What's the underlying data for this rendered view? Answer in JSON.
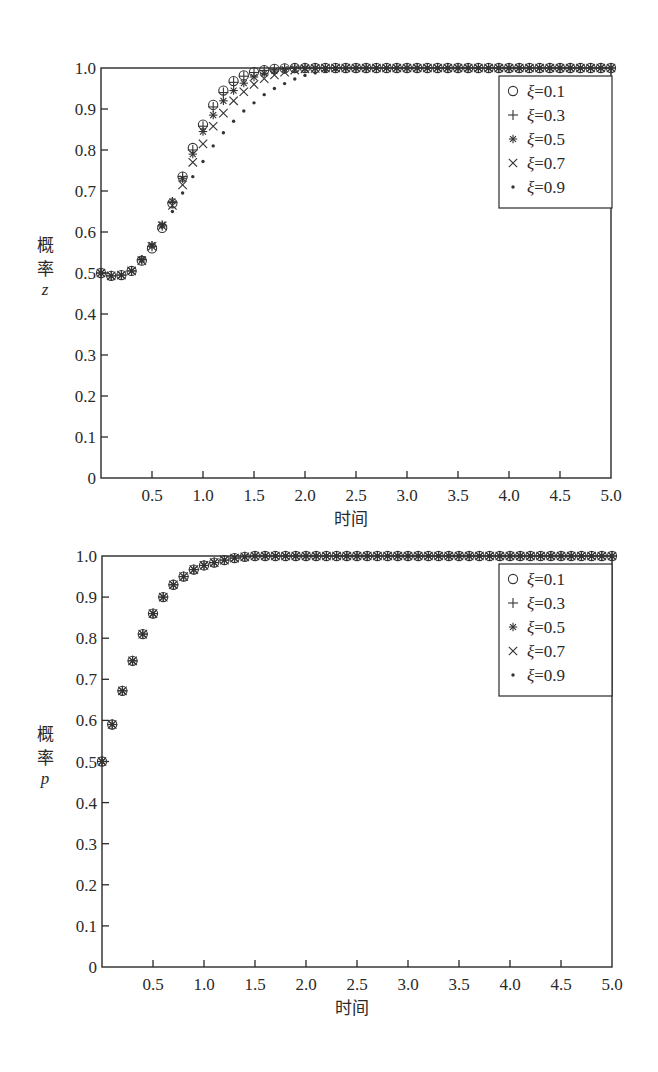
{
  "chart_data": [
    {
      "type": "scatter",
      "title": "",
      "xlabel": "时间",
      "ylabel": [
        "概",
        "率",
        "z"
      ],
      "xlim": [
        0,
        5.0
      ],
      "ylim": [
        0,
        1.0
      ],
      "grid": false,
      "legend_position": "upper right",
      "x_ticks": [
        "0.5",
        "1.0",
        "1.5",
        "2.0",
        "2.5",
        "3.0",
        "3.5",
        "4.0",
        "4.5",
        "5.0"
      ],
      "y_ticks": [
        "0",
        "0.1",
        "0.2",
        "0.3",
        "0.4",
        "0.5",
        "0.6",
        "0.7",
        "0.8",
        "0.9",
        "1.0"
      ],
      "x_step": 0.1,
      "x": [
        0.0,
        0.1,
        0.2,
        0.3,
        0.4,
        0.5,
        0.6,
        0.7,
        0.8,
        0.9,
        1.0,
        1.1,
        1.2,
        1.3,
        1.4,
        1.5,
        1.6,
        1.7,
        1.8,
        1.9,
        2.0,
        2.1,
        2.2,
        2.3,
        2.4,
        2.5,
        2.6,
        2.7,
        2.8,
        2.9,
        3.0,
        3.1,
        3.2,
        3.3,
        3.4,
        3.5,
        3.6,
        3.7,
        3.8,
        3.9,
        4.0,
        4.1,
        4.2,
        4.3,
        4.4,
        4.5,
        4.6,
        4.7,
        4.8,
        4.9,
        5.0
      ],
      "series": [
        {
          "name": "ξ=0.1",
          "marker": "circle",
          "values": [
            0.5,
            0.493,
            0.495,
            0.505,
            0.53,
            0.56,
            0.61,
            0.67,
            0.735,
            0.805,
            0.862,
            0.91,
            0.945,
            0.968,
            0.982,
            0.99,
            0.995,
            0.998,
            0.999,
            1.0,
            1.0,
            1.0,
            1.0,
            1.0,
            1.0,
            1.0,
            1.0,
            1.0,
            1.0,
            1.0,
            1.0,
            1.0,
            1.0,
            1.0,
            1.0,
            1.0,
            1.0,
            1.0,
            1.0,
            1.0,
            1.0,
            1.0,
            1.0,
            1.0,
            1.0,
            1.0,
            1.0,
            1.0,
            1.0,
            1.0,
            1.0
          ]
        },
        {
          "name": "ξ=0.3",
          "marker": "plus",
          "values": [
            0.5,
            0.493,
            0.495,
            0.505,
            0.532,
            0.565,
            0.615,
            0.672,
            0.735,
            0.8,
            0.858,
            0.905,
            0.94,
            0.965,
            0.98,
            0.989,
            0.994,
            0.997,
            0.999,
            1.0,
            1.0,
            1.0,
            1.0,
            1.0,
            1.0,
            1.0,
            1.0,
            1.0,
            1.0,
            1.0,
            1.0,
            1.0,
            1.0,
            1.0,
            1.0,
            1.0,
            1.0,
            1.0,
            1.0,
            1.0,
            1.0,
            1.0,
            1.0,
            1.0,
            1.0,
            1.0,
            1.0,
            1.0,
            1.0,
            1.0,
            1.0
          ]
        },
        {
          "name": "ξ=0.5",
          "marker": "asterisk",
          "values": [
            0.5,
            0.493,
            0.495,
            0.505,
            0.533,
            0.568,
            0.618,
            0.675,
            0.73,
            0.79,
            0.845,
            0.885,
            0.92,
            0.945,
            0.963,
            0.978,
            0.987,
            0.993,
            0.997,
            0.999,
            1.0,
            1.0,
            1.0,
            1.0,
            1.0,
            1.0,
            1.0,
            1.0,
            1.0,
            1.0,
            1.0,
            1.0,
            1.0,
            1.0,
            1.0,
            1.0,
            1.0,
            1.0,
            1.0,
            1.0,
            1.0,
            1.0,
            1.0,
            1.0,
            1.0,
            1.0,
            1.0,
            1.0,
            1.0,
            1.0,
            1.0
          ]
        },
        {
          "name": "ξ=0.7",
          "marker": "cross",
          "values": [
            0.5,
            0.493,
            0.495,
            0.505,
            0.53,
            0.565,
            0.615,
            0.665,
            0.715,
            0.77,
            0.815,
            0.858,
            0.89,
            0.92,
            0.942,
            0.96,
            0.974,
            0.983,
            0.99,
            0.995,
            0.998,
            0.999,
            1.0,
            1.0,
            1.0,
            1.0,
            1.0,
            1.0,
            1.0,
            1.0,
            1.0,
            1.0,
            1.0,
            1.0,
            1.0,
            1.0,
            1.0,
            1.0,
            1.0,
            1.0,
            1.0,
            1.0,
            1.0,
            1.0,
            1.0,
            1.0,
            1.0,
            1.0,
            1.0,
            1.0,
            1.0
          ]
        },
        {
          "name": "ξ=0.9",
          "marker": "dot",
          "values": [
            0.5,
            0.493,
            0.495,
            0.505,
            0.53,
            0.565,
            0.612,
            0.65,
            0.695,
            0.735,
            0.772,
            0.81,
            0.842,
            0.87,
            0.895,
            0.915,
            0.935,
            0.95,
            0.962,
            0.973,
            0.982,
            0.988,
            0.993,
            0.996,
            0.998,
            1.0,
            1.0,
            1.0,
            1.0,
            1.0,
            1.0,
            1.0,
            1.0,
            1.0,
            1.0,
            1.0,
            1.0,
            1.0,
            1.0,
            1.0,
            1.0,
            1.0,
            1.0,
            1.0,
            1.0,
            1.0,
            1.0,
            1.0,
            1.0,
            1.0,
            1.0
          ]
        }
      ],
      "layout": {
        "left": 101,
        "right": 611,
        "top": 68,
        "bottom": 478
      }
    },
    {
      "type": "scatter",
      "title": "",
      "xlabel": "时间",
      "ylabel": [
        "概",
        "率",
        "p"
      ],
      "xlim": [
        0,
        5.0
      ],
      "ylim": [
        0,
        1.0
      ],
      "grid": false,
      "legend_position": "upper right",
      "x_ticks": [
        "0.5",
        "1.0",
        "1.5",
        "2.0",
        "2.5",
        "3.0",
        "3.5",
        "4.0",
        "4.5",
        "5.0"
      ],
      "y_ticks": [
        "0",
        "0.1",
        "0.2",
        "0.3",
        "0.4",
        "0.5",
        "0.6",
        "0.7",
        "0.8",
        "0.9",
        "1.0"
      ],
      "x_step": 0.1,
      "x": [
        0.0,
        0.1,
        0.2,
        0.3,
        0.4,
        0.5,
        0.6,
        0.7,
        0.8,
        0.9,
        1.0,
        1.1,
        1.2,
        1.3,
        1.4,
        1.5,
        1.6,
        1.7,
        1.8,
        1.9,
        2.0,
        2.1,
        2.2,
        2.3,
        2.4,
        2.5,
        2.6,
        2.7,
        2.8,
        2.9,
        3.0,
        3.1,
        3.2,
        3.3,
        3.4,
        3.5,
        3.6,
        3.7,
        3.8,
        3.9,
        4.0,
        4.1,
        4.2,
        4.3,
        4.4,
        4.5,
        4.6,
        4.7,
        4.8,
        4.9,
        5.0
      ],
      "series": [
        {
          "name": "ξ=0.1",
          "marker": "circle",
          "values": [
            0.5,
            0.59,
            0.672,
            0.745,
            0.81,
            0.86,
            0.9,
            0.93,
            0.95,
            0.967,
            0.977,
            0.984,
            0.99,
            0.995,
            0.998,
            1.0,
            1.0,
            1.0,
            1.0,
            1.0,
            1.0,
            1.0,
            1.0,
            1.0,
            1.0,
            1.0,
            1.0,
            1.0,
            1.0,
            1.0,
            1.0,
            1.0,
            1.0,
            1.0,
            1.0,
            1.0,
            1.0,
            1.0,
            1.0,
            1.0,
            1.0,
            1.0,
            1.0,
            1.0,
            1.0,
            1.0,
            1.0,
            1.0,
            1.0,
            1.0,
            1.0
          ]
        },
        {
          "name": "ξ=0.3",
          "marker": "plus",
          "values": [
            0.5,
            0.59,
            0.672,
            0.745,
            0.81,
            0.86,
            0.9,
            0.93,
            0.95,
            0.967,
            0.977,
            0.984,
            0.99,
            0.995,
            0.998,
            1.0,
            1.0,
            1.0,
            1.0,
            1.0,
            1.0,
            1.0,
            1.0,
            1.0,
            1.0,
            1.0,
            1.0,
            1.0,
            1.0,
            1.0,
            1.0,
            1.0,
            1.0,
            1.0,
            1.0,
            1.0,
            1.0,
            1.0,
            1.0,
            1.0,
            1.0,
            1.0,
            1.0,
            1.0,
            1.0,
            1.0,
            1.0,
            1.0,
            1.0,
            1.0,
            1.0
          ]
        },
        {
          "name": "ξ=0.5",
          "marker": "asterisk",
          "values": [
            0.5,
            0.59,
            0.672,
            0.745,
            0.81,
            0.86,
            0.9,
            0.93,
            0.95,
            0.967,
            0.977,
            0.984,
            0.99,
            0.995,
            0.998,
            1.0,
            1.0,
            1.0,
            1.0,
            1.0,
            1.0,
            1.0,
            1.0,
            1.0,
            1.0,
            1.0,
            1.0,
            1.0,
            1.0,
            1.0,
            1.0,
            1.0,
            1.0,
            1.0,
            1.0,
            1.0,
            1.0,
            1.0,
            1.0,
            1.0,
            1.0,
            1.0,
            1.0,
            1.0,
            1.0,
            1.0,
            1.0,
            1.0,
            1.0,
            1.0,
            1.0
          ]
        },
        {
          "name": "ξ=0.7",
          "marker": "cross",
          "values": [
            0.5,
            0.59,
            0.672,
            0.745,
            0.81,
            0.86,
            0.9,
            0.93,
            0.95,
            0.967,
            0.977,
            0.984,
            0.99,
            0.995,
            0.998,
            1.0,
            1.0,
            1.0,
            1.0,
            1.0,
            1.0,
            1.0,
            1.0,
            1.0,
            1.0,
            1.0,
            1.0,
            1.0,
            1.0,
            1.0,
            1.0,
            1.0,
            1.0,
            1.0,
            1.0,
            1.0,
            1.0,
            1.0,
            1.0,
            1.0,
            1.0,
            1.0,
            1.0,
            1.0,
            1.0,
            1.0,
            1.0,
            1.0,
            1.0,
            1.0,
            1.0
          ]
        },
        {
          "name": "ξ=0.9",
          "marker": "dot",
          "values": [
            0.5,
            0.59,
            0.672,
            0.745,
            0.81,
            0.86,
            0.9,
            0.93,
            0.95,
            0.967,
            0.977,
            0.984,
            0.99,
            0.995,
            0.998,
            1.0,
            1.0,
            1.0,
            1.0,
            1.0,
            1.0,
            1.0,
            1.0,
            1.0,
            1.0,
            1.0,
            1.0,
            1.0,
            1.0,
            1.0,
            1.0,
            1.0,
            1.0,
            1.0,
            1.0,
            1.0,
            1.0,
            1.0,
            1.0,
            1.0,
            1.0,
            1.0,
            1.0,
            1.0,
            1.0,
            1.0,
            1.0,
            1.0,
            1.0,
            1.0,
            1.0
          ]
        }
      ],
      "layout": {
        "left": 102,
        "right": 612,
        "top": 556,
        "bottom": 967
      }
    }
  ],
  "style": {
    "ink": "#2a2a2a",
    "marker_ink": "#333333",
    "background": "#ffffff"
  }
}
